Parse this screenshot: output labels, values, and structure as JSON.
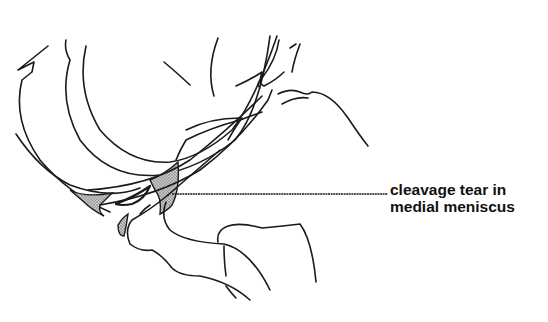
{
  "diagram": {
    "annotation": {
      "line1": "cleavage tear in",
      "line2": "medial meniscus"
    },
    "colors": {
      "line": "#1a1a1a",
      "background": "#ffffff",
      "shading": "#9a9a9a"
    }
  }
}
